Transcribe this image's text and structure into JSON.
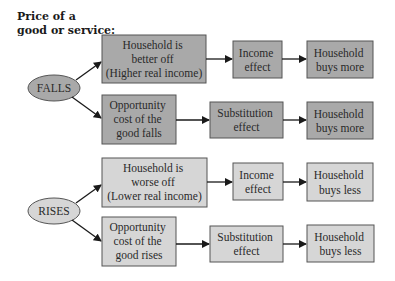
{
  "title": {
    "line1": "Price of a",
    "line2": "good or service:"
  },
  "colors": {
    "dark_fill": "#a9a9a9",
    "light_fill": "#d6d6d6",
    "stroke": "#555555",
    "arrow": "#1a1a1a"
  },
  "falls": {
    "label": "FALLS",
    "income_path": {
      "cause": [
        "Household is",
        "better off",
        "(Higher real income)"
      ],
      "effect": [
        "Income",
        "effect"
      ],
      "result": [
        "Household",
        "buys more"
      ]
    },
    "substitution_path": {
      "cause": [
        "Opportunity",
        "cost of the",
        "good falls"
      ],
      "effect": [
        "Substitution",
        "effect"
      ],
      "result": [
        "Household",
        "buys more"
      ]
    }
  },
  "rises": {
    "label": "RISES",
    "income_path": {
      "cause": [
        "Household is",
        "worse off",
        "(Lower real income)"
      ],
      "effect": [
        "Income",
        "effect"
      ],
      "result": [
        "Household",
        "buys less"
      ]
    },
    "substitution_path": {
      "cause": [
        "Opportunity",
        "cost of the",
        "good rises"
      ],
      "effect": [
        "Substitution",
        "effect"
      ],
      "result": [
        "Household",
        "buys less"
      ]
    }
  }
}
